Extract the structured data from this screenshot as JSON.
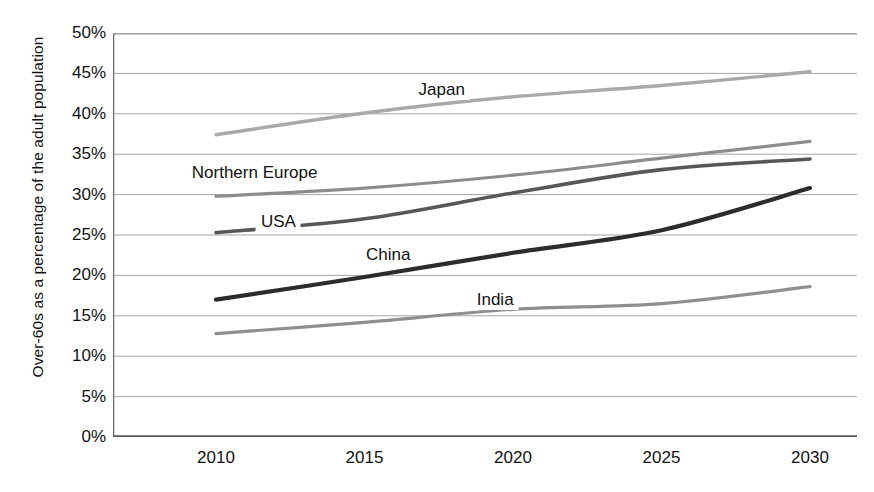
{
  "chart_data": {
    "type": "line",
    "title": "",
    "xlabel": "",
    "ylabel": "Over-60s as a percentage of the adult population",
    "x": [
      2010,
      2015,
      2020,
      2025,
      2030
    ],
    "xticklabels": [
      "2010",
      "2015",
      "2020",
      "2025",
      "2030"
    ],
    "yticklabels": [
      "0%",
      "5%",
      "10%",
      "15%",
      "20%",
      "25%",
      "30%",
      "35%",
      "40%",
      "45%",
      "50%"
    ],
    "yticks": [
      0,
      5,
      10,
      15,
      20,
      25,
      30,
      35,
      40,
      45,
      50
    ],
    "ylim": [
      0,
      50
    ],
    "xlim": [
      2010,
      2030
    ],
    "grid": "horizontal",
    "legend": "inline-labels",
    "series": [
      {
        "name": "Japan",
        "color": "#a9a9a9",
        "values": [
          37.4,
          40.1,
          42.1,
          43.5,
          45.2
        ],
        "label_x": 2017.6,
        "label_y": 42.9
      },
      {
        "name": "Northern Europe",
        "color": "#8c8c8c",
        "values": [
          29.8,
          30.8,
          32.4,
          34.5,
          36.6
        ],
        "label_x": 2011.3,
        "label_y": 32.7
      },
      {
        "name": "USA",
        "color": "#575757",
        "values": [
          25.3,
          27.0,
          30.2,
          33.1,
          34.4
        ],
        "label_x": 2012.1,
        "label_y": 26.6
      },
      {
        "name": "China",
        "color": "#2c2c2c",
        "values": [
          17.0,
          19.8,
          22.8,
          25.6,
          30.8
        ],
        "label_x": 2015.8,
        "label_y": 22.5
      },
      {
        "name": "India",
        "color": "#8f8f8f",
        "values": [
          12.8,
          14.2,
          15.8,
          16.5,
          18.6
        ],
        "label_x": 2019.4,
        "label_y": 16.9
      }
    ]
  }
}
